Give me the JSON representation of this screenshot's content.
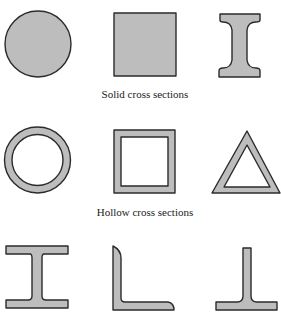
{
  "groups": [
    {
      "caption": "Solid cross sections",
      "shapes": [
        "solid circle",
        "solid square",
        "solid I-section (filleted)"
      ]
    },
    {
      "caption": "Hollow cross sections",
      "shapes": [
        "hollow circular tube",
        "hollow square tube",
        "hollow triangular tube"
      ]
    },
    {
      "caption": "",
      "shapes": [
        "wide-flange I-beam",
        "angle (L-section)",
        "tee section (inverted T)"
      ]
    }
  ],
  "colors": {
    "fill": "#bdbdbd",
    "outline": "#2b2b2b",
    "background": "#ffffff"
  }
}
